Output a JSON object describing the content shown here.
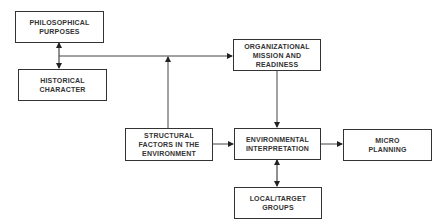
{
  "diagram": {
    "nodes": [
      {
        "id": "philosophical",
        "label": "PHILOSOPHICAL\nPURPOSES"
      },
      {
        "id": "historical",
        "label": "HISTORICAL\nCHARACTER"
      },
      {
        "id": "organizational",
        "label": "ORGANIZATIONAL\nMISSION AND\nREADINESS"
      },
      {
        "id": "structural",
        "label": "STRUCTURAL\nFACTORS IN THE\nENVIRONMENT"
      },
      {
        "id": "environmental",
        "label": "ENVIRONMENTAL\nINTERPRETATION"
      },
      {
        "id": "micro",
        "label": "MICRO\nPLANNING"
      },
      {
        "id": "local",
        "label": "LOCAL/TARGET\nGROUPS"
      }
    ],
    "edges": [
      {
        "from": "philosophical",
        "to": "historical",
        "type": "bidirectional"
      },
      {
        "from": "philosophical-historical-link",
        "to": "organizational",
        "type": "arrow"
      },
      {
        "from": "structural",
        "to": "philosophical-historical-link",
        "type": "arrow"
      },
      {
        "from": "organizational",
        "to": "environmental",
        "type": "arrow"
      },
      {
        "from": "structural",
        "to": "environmental",
        "type": "arrow"
      },
      {
        "from": "environmental",
        "to": "micro",
        "type": "arrow"
      },
      {
        "from": "environmental",
        "to": "local",
        "type": "bidirectional"
      }
    ]
  }
}
